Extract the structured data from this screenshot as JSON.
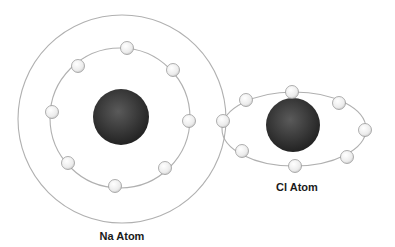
{
  "diagram": {
    "colors": {
      "background": "#ffffff",
      "orbit": "#b0b0b0",
      "nucleus_dark": "#1e1e1e",
      "nucleus_light": "#5a5a5a",
      "electron_fill": "#f4f4f4",
      "electron_stroke": "#9a9a9a"
    },
    "atoms": [
      {
        "id": "na",
        "label": "Na Atom",
        "label_pos": [
          122,
          230
        ],
        "nucleus": {
          "cx": 121,
          "cy": 117,
          "r": 28
        },
        "shells": [
          {
            "type": "circle",
            "cx": 122,
            "cy": 119,
            "r": 104,
            "electrons": []
          },
          {
            "type": "circle",
            "cx": 120,
            "cy": 118,
            "r": 70,
            "electrons": [
              [
                127,
                48
              ],
              [
                78,
                66
              ],
              [
                173,
                70
              ],
              [
                52,
                112
              ],
              [
                189,
                121
              ],
              [
                68,
                163
              ],
              [
                115,
                186
              ],
              [
                165,
                168
              ]
            ]
          }
        ]
      },
      {
        "id": "cl",
        "label": "Cl Atom",
        "label_pos": [
          297,
          181
        ],
        "nucleus": {
          "cx": 293,
          "cy": 125,
          "r": 27
        },
        "shells": [
          {
            "type": "ellipse",
            "cx": 294,
            "cy": 129,
            "rx": 72,
            "ry": 37,
            "electrons": [
              [
                246,
                100
              ],
              [
                292,
                92
              ],
              [
                339,
                103
              ],
              [
                365,
                130
              ],
              [
                347,
                157
              ],
              [
                295,
                166
              ],
              [
                242,
                151
              ]
            ]
          }
        ]
      }
    ],
    "shared_electron": [
      223,
      121
    ]
  }
}
